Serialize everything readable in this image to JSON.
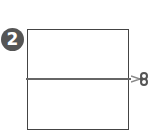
{
  "step": {
    "number": "2"
  },
  "diagram": {
    "shape": "rectangle",
    "cut_line": "horizontal-middle",
    "icon": "scissors-icon"
  },
  "colors": {
    "badge": "#555555",
    "outline": "#444444",
    "cut_line": "#666666",
    "scissors": "#555555"
  }
}
